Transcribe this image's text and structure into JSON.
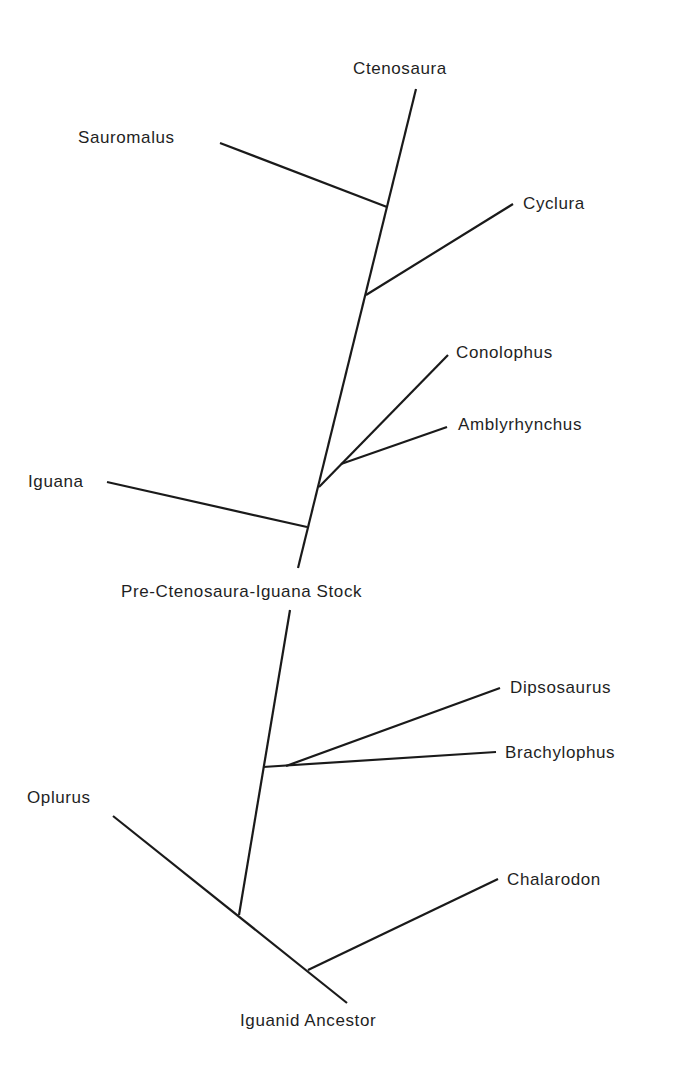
{
  "diagram": {
    "type": "phylogenetic-tree",
    "line_color": "#1a1a1a",
    "background": "#ffffff",
    "taxa": {
      "ctenosaura": "Ctenosaura",
      "sauromalus": "Sauromalus",
      "cyclura": "Cyclura",
      "conolophus": "Conolophus",
      "amblyrhynchus": "Amblyrhynchus",
      "iguana": "Iguana",
      "dipsosaurus": "Dipsosaurus",
      "brachylophus": "Brachylophus",
      "oplurus": "Oplurus",
      "chalarodon": "Chalarodon"
    },
    "nodes": {
      "pre_stock": "Pre-Ctenosaura-Iguana Stock",
      "ancestor": "Iguanid Ancestor"
    }
  }
}
